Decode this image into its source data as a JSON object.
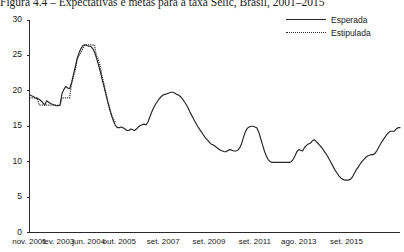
{
  "figure": {
    "title": "Figura 4.4 – Expectativas e metas para a taxa Selic, Brasil, 2001–2015"
  },
  "legend": {
    "position": "top-right",
    "items": [
      {
        "label": "Esperada",
        "style": "solid",
        "color": "#262626"
      },
      {
        "label": "Estipulada",
        "style": "dotted",
        "color": "#262626"
      }
    ]
  },
  "axes": {
    "y_ticks": [
      "30",
      "25",
      "20",
      "15",
      "10",
      "5",
      "0"
    ],
    "x_ticks": [
      "nov. 2001",
      "fev. 2003",
      "jun. 2004",
      "out. 2005",
      "set. 2007",
      "set. 2009",
      "set. 2011",
      "ago. 2013",
      "set. 2015"
    ]
  },
  "chart_data": {
    "type": "line",
    "title": "Figura 4.4 – Expectativas e metas para a taxa Selic, Brasil, 2001–2015",
    "xlabel": "",
    "ylabel": "",
    "ylim": [
      0,
      30
    ],
    "grid": false,
    "legend_position": "top-right",
    "x_tick_labels": [
      "nov. 2001",
      "fev. 2003",
      "jun. 2004",
      "out. 2005",
      "set. 2007",
      "set. 2009",
      "set. 2011",
      "ago. 2013",
      "set. 2015"
    ],
    "x_tick_indices": [
      0,
      15,
      31,
      47,
      70,
      94,
      118,
      141,
      166
    ],
    "y_ticks": [
      0,
      5,
      10,
      15,
      20,
      25,
      30
    ],
    "series": [
      {
        "name": "Esperada",
        "style": "solid",
        "color": "#262626",
        "values": [
          19.5,
          19.3,
          19.2,
          19.0,
          18.9,
          18.8,
          18.6,
          18.3,
          18.0,
          18.6,
          18.4,
          18.2,
          18.1,
          18.0,
          17.9,
          17.9,
          18.0,
          19.6,
          20.2,
          20.6,
          20.4,
          20.3,
          21.1,
          22.3,
          23.4,
          24.6,
          25.4,
          26.0,
          26.4,
          26.5,
          26.4,
          26.3,
          26.3,
          26.0,
          25.5,
          24.7,
          23.8,
          22.8,
          21.7,
          20.6,
          19.5,
          18.4,
          17.4,
          16.5,
          15.7,
          15.1,
          14.8,
          14.8,
          14.9,
          14.8,
          14.6,
          14.4,
          14.4,
          14.6,
          14.5,
          14.4,
          14.6,
          14.9,
          15.1,
          15.2,
          15.3,
          15.2,
          15.6,
          16.3,
          17.0,
          17.6,
          18.1,
          18.5,
          18.9,
          19.2,
          19.4,
          19.5,
          19.6,
          19.7,
          19.8,
          19.8,
          19.7,
          19.5,
          19.4,
          19.2,
          18.9,
          18.5,
          18.1,
          17.6,
          17.0,
          16.5,
          16.0,
          15.5,
          15.0,
          14.6,
          14.2,
          13.8,
          13.4,
          13.1,
          12.8,
          12.5,
          12.4,
          12.2,
          12.0,
          11.8,
          11.6,
          11.5,
          11.4,
          11.4,
          11.6,
          11.7,
          11.6,
          11.5,
          11.5,
          11.6,
          11.9,
          12.5,
          13.4,
          14.2,
          14.7,
          14.9,
          15.0,
          15.0,
          14.9,
          14.8,
          14.2,
          13.3,
          12.4,
          11.5,
          10.8,
          10.3,
          10.0,
          9.9,
          9.9,
          9.9,
          9.9,
          9.9,
          9.9,
          9.9,
          9.9,
          9.9,
          9.9,
          10.0,
          10.3,
          10.8,
          11.4,
          11.7,
          11.6,
          11.5,
          12.0,
          12.3,
          12.5,
          12.6,
          12.9,
          13.1,
          12.9,
          12.6,
          12.3,
          12.0,
          11.6,
          11.2,
          10.8,
          10.3,
          9.8,
          9.3,
          8.8,
          8.4,
          8.0,
          7.7,
          7.5,
          7.4,
          7.4,
          7.4,
          7.5,
          7.8,
          8.3,
          8.8,
          9.2,
          9.6,
          10.0,
          10.3,
          10.6,
          10.8,
          10.9,
          11.0,
          11.0,
          11.2,
          11.6,
          12.1,
          12.6,
          13.0,
          13.4,
          13.8,
          14.1,
          14.3,
          14.3,
          14.3,
          14.6,
          14.8,
          14.8
        ]
      },
      {
        "name": "Estipulada",
        "style": "dotted",
        "color": "#262626",
        "values": [
          19.0,
          19.0,
          19.0,
          19.0,
          19.0,
          18.0,
          18.0,
          18.0,
          18.0,
          18.0,
          18.0,
          18.0,
          18.0,
          18.0,
          18.0,
          18.0,
          18.0,
          19.0,
          19.0,
          19.0,
          19.0,
          19.0,
          21.0,
          22.0,
          23.0,
          24.5,
          25.0,
          25.5,
          26.0,
          26.5,
          26.5,
          26.5,
          26.5,
          26.5,
          26.5,
          25.0,
          24.5,
          23.5,
          22.0,
          21.0,
          19.7,
          18.5,
          17.5,
          16.5,
          16.0,
          15.5,
          15.3,
          15.3,
          15.3,
          15.3,
          15.0,
          15.0,
          15.0,
          15.0,
          15.0,
          15.0,
          15.0,
          15.0,
          15.0,
          15.0,
          15.0,
          15.0,
          15.0,
          15.5,
          16.0,
          16.5,
          17.0,
          17.5,
          18.0,
          18.5,
          19.0,
          19.3,
          19.5,
          19.5,
          19.5,
          19.5,
          19.5,
          19.5,
          19.5,
          19.5,
          19.0,
          18.5,
          18.0,
          17.5,
          17.0,
          16.5,
          16.0,
          15.5,
          15.0,
          14.5,
          14.0,
          13.8,
          13.5,
          13.3,
          13.0,
          12.8,
          12.5,
          12.3,
          12.0,
          11.8,
          11.6,
          11.5,
          11.3,
          11.3,
          11.3,
          11.3,
          11.3,
          11.3,
          11.3,
          11.3,
          11.8,
          12.5,
          13.3,
          14.0,
          14.5,
          14.8,
          15.0,
          15.0,
          15.0,
          14.5,
          13.8,
          13.0,
          12.0,
          11.3,
          10.5,
          10.0,
          9.8,
          9.5,
          9.3,
          9.3,
          9.3,
          9.3,
          9.3,
          9.3,
          9.3,
          9.5,
          9.8,
          10.3,
          10.8,
          11.3,
          11.5,
          11.5,
          11.5,
          12.0,
          12.3,
          12.5,
          12.8,
          13.0,
          13.0,
          12.8,
          12.5,
          12.3,
          12.0,
          11.5,
          11.0,
          10.5,
          10.0,
          9.5,
          9.0,
          8.5,
          8.3,
          8.0,
          7.8,
          7.5,
          7.3,
          7.3,
          7.3,
          7.5,
          8.0,
          8.5,
          9.0,
          9.5,
          9.8,
          10.0,
          10.5,
          10.8,
          11.0,
          11.0,
          11.0,
          11.0,
          11.3,
          11.8,
          12.3,
          12.8,
          13.3,
          13.8,
          14.0,
          14.3,
          14.3,
          14.3,
          14.3,
          14.8,
          14.8,
          14.8
        ]
      }
    ],
    "estipulada_draw_range": [
      0,
      45
    ],
    "annotations": []
  }
}
